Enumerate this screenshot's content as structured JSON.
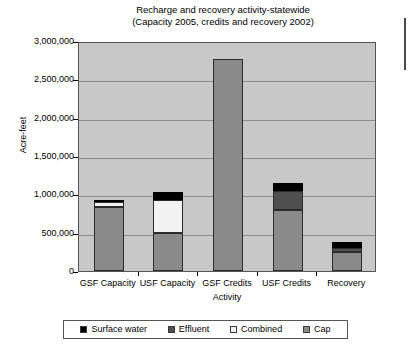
{
  "chart_data": {
    "type": "bar",
    "stacked": true,
    "title": "Recharge and recovery activity-statewide",
    "subtitle": "(Capacity 2005, credits and recovery 2002)",
    "xlabel": "Activity",
    "ylabel": "Acre-feet",
    "ylim": [
      0,
      3000000
    ],
    "ytick_values": [
      0,
      500000,
      1000000,
      1500000,
      2000000,
      2500000,
      3000000
    ],
    "ytick_labels": [
      "0",
      "500,000",
      "1,000,000",
      "1,500,000",
      "2,000,000",
      "2,500,000",
      "3,000,000"
    ],
    "grid": true,
    "legend_position": "bottom",
    "categories": [
      "GSF Capacity",
      "USF Capacity",
      "GSF Credits",
      "USF Credits",
      "Recovery"
    ],
    "series": [
      {
        "name": "Surface water",
        "color": "#000000",
        "values": [
          30000,
          105000,
          0,
          110000,
          80000
        ]
      },
      {
        "name": "Effluent",
        "color": "#4f4f4f",
        "values": [
          0,
          0,
          0,
          240000,
          50000
        ]
      },
      {
        "name": "Combined",
        "color": "#f2f2f2",
        "values": [
          65000,
          420000,
          0,
          0,
          0
        ]
      },
      {
        "name": "Cap",
        "color": "#8a8a8a",
        "values": [
          835000,
          500000,
          2760000,
          800000,
          245000
        ]
      }
    ],
    "totals": [
      930000,
      1025000,
      2760000,
      1150000,
      375000
    ]
  },
  "legend": {
    "items": [
      {
        "label": "Surface water",
        "color": "#000000"
      },
      {
        "label": "Effluent",
        "color": "#4f4f4f"
      },
      {
        "label": "Combined",
        "color": "#f2f2f2"
      },
      {
        "label": "Cap",
        "color": "#8a8a8a"
      }
    ]
  }
}
